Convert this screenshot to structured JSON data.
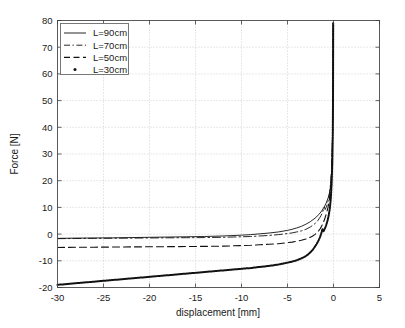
{
  "chart_data": {
    "type": "line",
    "title": "",
    "subtitle": "",
    "xlabel": "displacement [mm]",
    "ylabel": "Force [N]",
    "xlim": [
      -30,
      5
    ],
    "ylim": [
      -20,
      80
    ],
    "xticks": [
      -30,
      -25,
      -20,
      -15,
      -10,
      -5,
      0,
      5
    ],
    "yticks": [
      -20,
      -10,
      0,
      10,
      20,
      30,
      40,
      50,
      60,
      70,
      80
    ],
    "xticklabels": [
      "-30",
      "-25",
      "-20",
      "-15",
      "-10",
      "-5",
      "0",
      "5"
    ],
    "yticklabels": [
      "-20",
      "-10",
      "0",
      "10",
      "20",
      "30",
      "40",
      "50",
      "60",
      "70",
      "80"
    ],
    "grid": true,
    "grid_style": "dotted",
    "grid_color": "#bfbfbf",
    "legend_position": "upper left",
    "line_color": "#111111",
    "series": [
      {
        "name": "L=90cm",
        "style": "solid",
        "linewidth": 0.9,
        "x": [
          -30,
          -28,
          -26,
          -24,
          -22,
          -20,
          -18,
          -16,
          -14,
          -12,
          -10,
          -9,
          -8,
          -7,
          -6,
          -5,
          -4.5,
          -4,
          -3.5,
          -3,
          -2.5,
          -2,
          -1.6,
          -1.3,
          -1.0,
          -0.8,
          -0.6,
          -0.45,
          -0.35,
          -0.28,
          -0.22,
          -0.18,
          -0.15,
          -0.12,
          -0.1,
          -0.08,
          -0.06,
          -0.05,
          -0.04,
          -0.03
        ],
        "y": [
          -1.6,
          -1.5,
          -1.45,
          -1.4,
          -1.3,
          -1.2,
          -1.1,
          -1.0,
          -0.9,
          -0.7,
          -0.4,
          -0.2,
          0.1,
          0.4,
          0.8,
          1.4,
          1.8,
          2.3,
          2.9,
          3.7,
          4.7,
          6.0,
          7.3,
          8.6,
          10.2,
          11.6,
          13.4,
          15.2,
          17.2,
          19.5,
          22.5,
          25.5,
          28.5,
          33.0,
          37.0,
          43.0,
          52.0,
          58.0,
          66.0,
          79.0
        ]
      },
      {
        "name": "L=70cm",
        "style": "dashdot",
        "linewidth": 0.9,
        "x": [
          -30,
          -28,
          -26,
          -24,
          -22,
          -20,
          -18,
          -16,
          -14,
          -12,
          -10,
          -9,
          -8,
          -7,
          -6,
          -5,
          -4.5,
          -4,
          -3.5,
          -3,
          -2.5,
          -2.2,
          -1.9,
          -1.7,
          -1.5,
          -1.35,
          -1.2,
          -1.1,
          -1.0,
          -0.9,
          -0.8,
          -0.7,
          -0.6,
          -0.5,
          -0.4,
          -0.3,
          -0.22,
          -0.16,
          -0.11,
          -0.07,
          -0.045,
          -0.03
        ],
        "y": [
          -1.7,
          -1.65,
          -1.6,
          -1.55,
          -1.5,
          -1.45,
          -1.4,
          -1.35,
          -1.3,
          -1.2,
          -1.0,
          -0.9,
          -0.7,
          -0.5,
          -0.2,
          0.2,
          0.45,
          0.8,
          1.2,
          1.8,
          2.7,
          3.4,
          4.3,
          5.1,
          6.1,
          7.0,
          8.1,
          9.0,
          10.2,
          9.2,
          10.0,
          11.0,
          12.2,
          13.8,
          16.0,
          19.5,
          23.5,
          29.0,
          37.0,
          48.0,
          62.0,
          79.0
        ]
      },
      {
        "name": "L=50cm",
        "style": "dashed",
        "linewidth": 1.1,
        "x": [
          -30,
          -28,
          -26,
          -24,
          -22,
          -20,
          -18,
          -16,
          -14,
          -12,
          -10,
          -9,
          -8,
          -7,
          -6,
          -5,
          -4.5,
          -4,
          -3.5,
          -3,
          -2.6,
          -2.3,
          -2.0,
          -1.8,
          -1.6,
          -1.45,
          -1.3,
          -1.2,
          -1.1,
          -1.0,
          -0.9,
          -0.8,
          -0.7,
          -0.6,
          -0.5,
          -0.4,
          -0.3,
          -0.22,
          -0.15,
          -0.1,
          -0.06,
          -0.035
        ],
        "y": [
          -5.0,
          -4.95,
          -4.9,
          -4.85,
          -4.8,
          -4.75,
          -4.7,
          -4.65,
          -4.6,
          -4.5,
          -4.3,
          -4.2,
          -4.0,
          -3.8,
          -3.6,
          -3.2,
          -3.0,
          -2.7,
          -2.3,
          -1.8,
          -1.3,
          -0.8,
          -0.1,
          0.5,
          1.3,
          2.0,
          2.9,
          3.6,
          4.4,
          5.3,
          6.3,
          7.4,
          8.6,
          10.0,
          11.8,
          14.2,
          17.8,
          22.0,
          28.5,
          37.0,
          52.0,
          79.0
        ]
      },
      {
        "name": "L=30cm",
        "style": "dotted-marker",
        "linewidth": 2.0,
        "x": [
          -30,
          -28,
          -26,
          -24,
          -22,
          -20,
          -18,
          -16,
          -14,
          -12,
          -10,
          -9,
          -8,
          -7,
          -6,
          -5,
          -4.5,
          -4,
          -3.5,
          -3.2,
          -3.0,
          -2.8,
          -2.6,
          -2.4,
          -2.2,
          -2.0,
          -1.85,
          -1.7,
          -1.6,
          -1.5,
          -1.42,
          -1.35,
          -1.3,
          -1.25,
          -1.2,
          -1.1,
          -1.0,
          -0.9,
          -0.8,
          -0.7,
          -0.6,
          -0.5,
          -0.4,
          -0.3,
          -0.2,
          -0.13,
          -0.08,
          -0.05,
          -0.03
        ],
        "y": [
          -19.0,
          -18.4,
          -17.8,
          -17.2,
          -16.6,
          -16.0,
          -15.4,
          -14.8,
          -14.2,
          -13.6,
          -13.0,
          -12.7,
          -12.3,
          -11.9,
          -11.4,
          -10.7,
          -10.3,
          -9.8,
          -9.1,
          -8.6,
          -8.2,
          -7.7,
          -7.1,
          -6.4,
          -5.6,
          -4.6,
          -3.8,
          -2.9,
          -2.2,
          -1.4,
          -0.7,
          0.0,
          0.6,
          1.2,
          1.9,
          1.0,
          1.6,
          2.4,
          3.3,
          4.4,
          5.7,
          7.4,
          9.6,
          13.0,
          19.0,
          26.5,
          37.0,
          52.0,
          79.0
        ]
      }
    ],
    "annotations": [
      {
        "label": "asymptote",
        "x": 0,
        "description": "all curves rise steeply toward 80 N as displacement approaches 0"
      }
    ]
  },
  "legend": {
    "entries": [
      {
        "label": "L=90cm",
        "style": "solid"
      },
      {
        "label": "L=70cm",
        "style": "dashdot"
      },
      {
        "label": "L=50cm",
        "style": "dashed"
      },
      {
        "label": "L=30cm",
        "style": "dotted-marker"
      }
    ]
  }
}
